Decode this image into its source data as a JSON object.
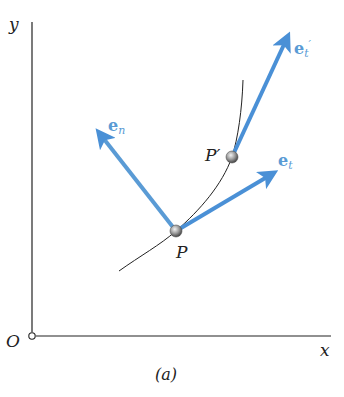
{
  "figure": {
    "caption": "(a)",
    "axes": {
      "x_label": "x",
      "y_label": "y",
      "origin_label": "O"
    },
    "points": {
      "p": {
        "label": "P"
      },
      "p_prime": {
        "label": "P′"
      }
    },
    "vectors": {
      "e_n": {
        "base": "e",
        "sub": "n"
      },
      "e_t": {
        "base": "e",
        "sub": "t"
      },
      "e_t_prime": {
        "base": "e",
        "sub": "t",
        "prime": "′"
      }
    },
    "colors": {
      "vector": "#5a9bd5",
      "vector_label": "#5a9bd5",
      "axis": "#222222",
      "curve": "#222222",
      "particle": "#8a8a8a"
    }
  }
}
